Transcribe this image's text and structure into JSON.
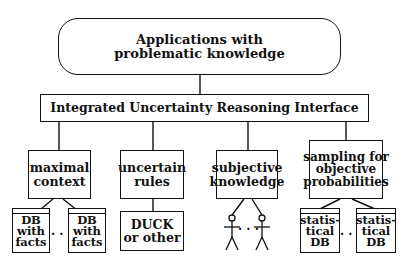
{
  "diagram": {
    "top": {
      "line1": "Applications with",
      "line2": "problematic knowledge"
    },
    "interface": {
      "label": "Integrated Uncertainty Reasoning Interface"
    },
    "categories": [
      {
        "line1": "maximal",
        "line2": "context"
      },
      {
        "line1": "uncertain",
        "line2": "rules"
      },
      {
        "line1": "subjective",
        "line2": "knowledge"
      },
      {
        "line1": "sampling for",
        "line2": "objective",
        "line3": "probabilities"
      }
    ],
    "sources": {
      "db_facts": {
        "line1": "DB",
        "line2": "with",
        "line3": "facts"
      },
      "duck": {
        "line1": "DUCK",
        "line2": "or other"
      },
      "stat_db": {
        "line1": "statis-",
        "line2": "tical",
        "line3": "DB"
      },
      "ellipsis": "· · ·"
    },
    "colors": {
      "stroke": "#111111",
      "background": "#ffffff"
    }
  }
}
